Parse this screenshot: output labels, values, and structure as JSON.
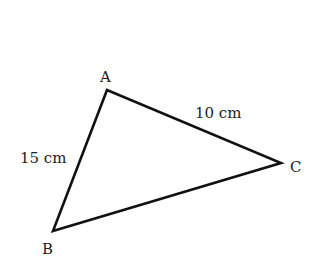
{
  "diagram": {
    "type": "triangle",
    "vertices": [
      {
        "id": "A",
        "label": "A",
        "x": 107,
        "y": 90
      },
      {
        "id": "B",
        "label": "B",
        "x": 53,
        "y": 231
      },
      {
        "id": "C",
        "label": "C",
        "x": 281,
        "y": 163
      }
    ],
    "sides": [
      {
        "from": "A",
        "to": "B",
        "length_label": "15 cm"
      },
      {
        "from": "A",
        "to": "C",
        "length_label": "10 cm"
      },
      {
        "from": "B",
        "to": "C",
        "length_label": ""
      }
    ],
    "stroke_color": "#111111",
    "text_color": "#222222"
  }
}
